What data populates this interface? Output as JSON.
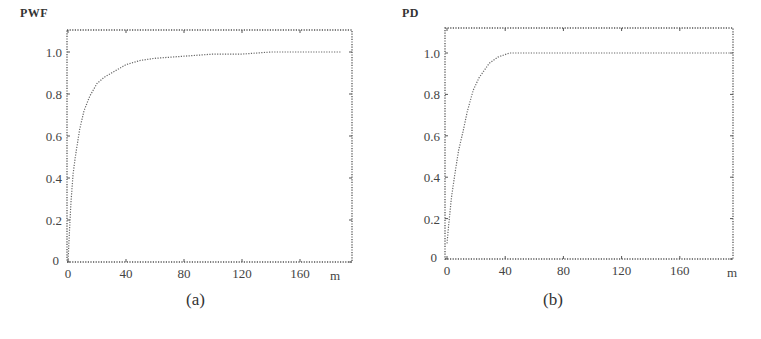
{
  "figure": {
    "panels": [
      {
        "id": "a",
        "ylabel": "PWF",
        "xlabel": "m",
        "caption": "(a)"
      },
      {
        "id": "b",
        "ylabel": "PD",
        "xlabel": "m",
        "caption": "(b)"
      }
    ]
  },
  "chart_data": [
    {
      "type": "line",
      "title": "",
      "caption": "(a)",
      "xlabel": "m",
      "ylabel": "PWF",
      "xlim": [
        0,
        195
      ],
      "ylim": [
        0,
        1.1
      ],
      "xticks": [
        0,
        40,
        80,
        120,
        160
      ],
      "yticks": [
        0,
        0.2,
        0.4,
        0.6,
        0.8,
        1.0
      ],
      "grid": false,
      "line_style": "dotted",
      "series": [
        {
          "name": "PWF",
          "x": [
            0,
            1,
            2,
            3.5,
            5,
            8,
            11,
            15,
            20,
            25,
            30,
            40,
            50,
            60,
            80,
            100,
            120,
            140,
            160,
            188
          ],
          "values": [
            0.0,
            0.15,
            0.28,
            0.42,
            0.5,
            0.63,
            0.72,
            0.79,
            0.85,
            0.88,
            0.9,
            0.94,
            0.96,
            0.97,
            0.98,
            0.99,
            0.99,
            1.0,
            1.0,
            1.0
          ]
        }
      ]
    },
    {
      "type": "line",
      "title": "",
      "caption": "(b)",
      "xlabel": "m",
      "ylabel": "PD",
      "xlim": [
        0,
        195
      ],
      "ylim": [
        0,
        1.1
      ],
      "xticks": [
        0,
        40,
        80,
        120,
        160
      ],
      "yticks": [
        0,
        0.2,
        0.4,
        0.6,
        0.8,
        1.0
      ],
      "grid": false,
      "line_style": "dotted",
      "series": [
        {
          "name": "PD",
          "x": [
            0,
            1,
            3,
            5.5,
            8,
            11,
            14,
            18,
            22,
            29,
            35,
            43,
            50,
            60,
            80,
            120,
            160,
            195
          ],
          "values": [
            0.08,
            0.16,
            0.3,
            0.42,
            0.53,
            0.62,
            0.72,
            0.82,
            0.88,
            0.95,
            0.98,
            1.0,
            1.0,
            1.0,
            1.0,
            1.0,
            1.0,
            1.0
          ]
        }
      ]
    }
  ]
}
